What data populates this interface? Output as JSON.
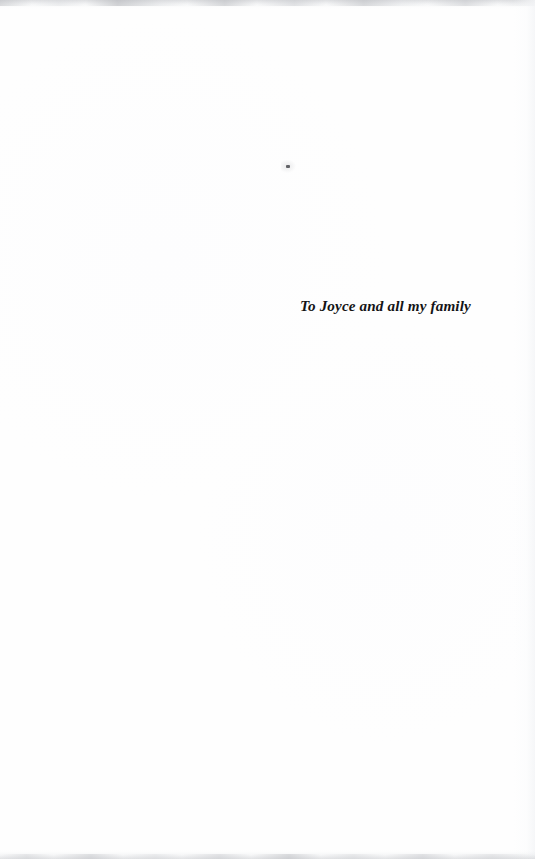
{
  "page": {
    "kind": "book-dedication-page",
    "width": 535,
    "height": 859,
    "background_color": "#fefefe",
    "text_color": "#141416"
  },
  "dedication": {
    "text": "To Joyce and all my family"
  },
  "artifacts": {
    "dust_speck_color": "#4e5054",
    "edge_shadow_color": "#c4c6ca"
  }
}
